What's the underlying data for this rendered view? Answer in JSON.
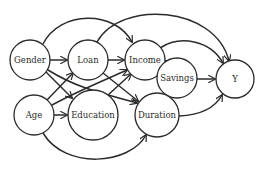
{
  "diagram": {
    "type": "causal-graph",
    "colors": {
      "stroke": "#2b2b2b",
      "node_fill": "#ffffff",
      "background": "#ffffff"
    },
    "nodes": [
      {
        "id": "gender",
        "label": "Gender",
        "cx": 30,
        "cy": 60,
        "r": 20
      },
      {
        "id": "loan",
        "label": "Loan",
        "cx": 88,
        "cy": 60,
        "r": 20
      },
      {
        "id": "income",
        "label": "Income",
        "cx": 145,
        "cy": 60,
        "r": 20
      },
      {
        "id": "savings",
        "label": "Savings",
        "cx": 177,
        "cy": 78,
        "r": 20
      },
      {
        "id": "y",
        "label": "Y",
        "cx": 235,
        "cy": 79,
        "r": 19
      },
      {
        "id": "age",
        "label": "Age",
        "cx": 34,
        "cy": 115,
        "r": 20
      },
      {
        "id": "education",
        "label": "Education",
        "cx": 93,
        "cy": 115,
        "r": 25
      },
      {
        "id": "duration",
        "label": "Duration",
        "cx": 157,
        "cy": 115,
        "r": 22
      }
    ],
    "edges": [
      {
        "from": "gender",
        "to": "loan"
      },
      {
        "from": "loan",
        "to": "income"
      },
      {
        "from": "income",
        "to": "savings"
      },
      {
        "from": "savings",
        "to": "y"
      },
      {
        "from": "gender",
        "to": "income"
      },
      {
        "from": "loan",
        "to": "y"
      },
      {
        "from": "income",
        "to": "y"
      },
      {
        "from": "duration",
        "to": "y"
      },
      {
        "from": "age",
        "to": "education"
      },
      {
        "from": "age",
        "to": "duration"
      },
      {
        "from": "gender",
        "to": "education"
      },
      {
        "from": "gender",
        "to": "duration"
      },
      {
        "from": "age",
        "to": "loan"
      },
      {
        "from": "age",
        "to": "income"
      },
      {
        "from": "loan",
        "to": "duration"
      },
      {
        "from": "education",
        "to": "income"
      }
    ]
  }
}
